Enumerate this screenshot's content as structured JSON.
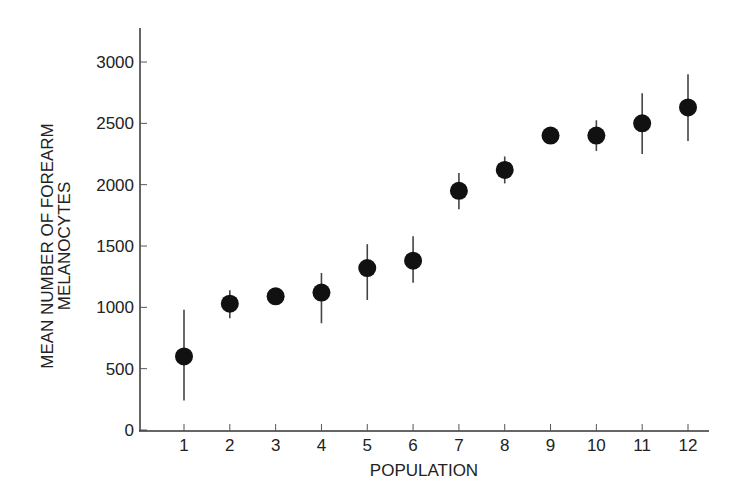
{
  "chart_data": {
    "type": "scatter",
    "title": "",
    "xlabel": "POPULATION",
    "ylabel_lines": [
      "MEAN NUMBER OF FOREARM",
      "MELANOCYTES"
    ],
    "ylabel": "MEAN NUMBER OF FOREARM MELANOCYTES",
    "x": [
      1,
      2,
      3,
      4,
      5,
      6,
      7,
      8,
      9,
      10,
      11,
      12
    ],
    "categories": [
      "1",
      "2",
      "3",
      "4",
      "5",
      "6",
      "7",
      "8",
      "9",
      "10",
      "11",
      "12"
    ],
    "series": [
      {
        "name": "Mean melanocytes",
        "values": [
          600,
          1030,
          1090,
          1120,
          1320,
          1380,
          1950,
          2120,
          2400,
          2400,
          2500,
          2630
        ],
        "error_low": [
          240,
          910,
          1060,
          870,
          1060,
          1200,
          1800,
          2010,
          2340,
          2275,
          2250,
          2355
        ],
        "error_high": [
          980,
          1140,
          1120,
          1280,
          1515,
          1580,
          2095,
          2230,
          2450,
          2525,
          2745,
          2900
        ]
      }
    ],
    "yticks": [
      0,
      500,
      1000,
      1500,
      2000,
      2500,
      3000
    ],
    "ytick_labels": [
      "0",
      "500",
      "1000",
      "1500",
      "2000",
      "2500",
      "3000"
    ],
    "xticks": [
      1,
      2,
      3,
      4,
      5,
      6,
      7,
      8,
      9,
      10,
      11,
      12
    ],
    "ylim": [
      0,
      3300
    ],
    "xlim": [
      0,
      12.5
    ],
    "grid": false,
    "legend": null,
    "marker_color": "#111111",
    "axis_color": "#333333"
  }
}
